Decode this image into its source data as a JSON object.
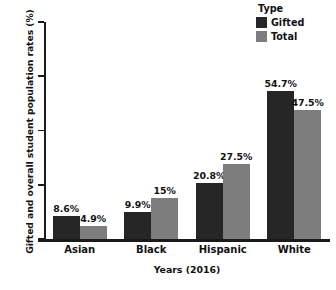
{
  "chart_data": {
    "type": "bar",
    "title": "",
    "xlabel": "Years (2016)",
    "ylabel": "Gifted and overall student population rates (%)",
    "categories": [
      "Asian",
      "Black",
      "Hispanic",
      "White"
    ],
    "series": [
      {
        "name": "Gifted",
        "color": "#262626",
        "values": [
          8.6,
          9.9,
          20.8,
          54.7
        ],
        "labels": [
          "8.6%",
          "9.9%",
          "20.8%",
          "54.7%"
        ]
      },
      {
        "name": "Total",
        "color": "#7d7d7d",
        "values": [
          4.9,
          15.0,
          27.5,
          47.5
        ],
        "labels": [
          "4.9%",
          "15%",
          "27.5%",
          "47.5%"
        ]
      }
    ],
    "ylim": [
      0,
      80
    ],
    "yticks": [
      0,
      20,
      40,
      60,
      80
    ],
    "ytick_labels": [
      "0",
      "20",
      "40",
      "60",
      "80"
    ],
    "grid": false,
    "legend": {
      "title": "Type",
      "position": "top-right",
      "entries": [
        "Gifted",
        "Total"
      ]
    }
  },
  "axes": {
    "y_title": "Gifted and overall student population rates (%)",
    "x_title": "Years (2016)"
  },
  "legend": {
    "title": "Type",
    "items": [
      {
        "label": "Gifted",
        "color": "#262626"
      },
      {
        "label": "Total",
        "color": "#7d7d7d"
      }
    ]
  }
}
